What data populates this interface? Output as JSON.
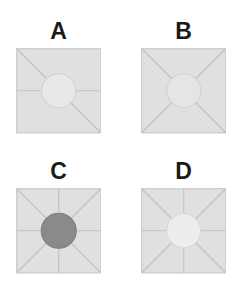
{
  "figure": {
    "background_color": "#ffffff",
    "square_fill": "#e0e0e0",
    "square_stroke": "#cfcfcf",
    "spoke_color": "#c2c2c2",
    "label_color": "#1a1a1a",
    "square_size": 84,
    "circle_radius": 17
  },
  "panels": [
    {
      "id": "a",
      "label": "A",
      "circle_fill": "#e9e9e9",
      "circle_stroke": "#d2d2d2",
      "circle_shade": "light",
      "spokes": [
        "top-left",
        "bottom-right",
        "left",
        "right"
      ],
      "spoke_count": 4,
      "pattern": "diagonal-and-horizontal"
    },
    {
      "id": "b",
      "label": "B",
      "circle_fill": "#e5e5e5",
      "circle_stroke": "#d2d2d2",
      "circle_shade": "light",
      "spokes": [
        "top-left",
        "top-right",
        "bottom-left",
        "bottom-right"
      ],
      "spoke_count": 4,
      "pattern": "diagonals-only"
    },
    {
      "id": "c",
      "label": "C",
      "circle_fill": "#8a8a8a",
      "circle_stroke": "#7e7e7e",
      "circle_shade": "dark",
      "spokes": [
        "top-left",
        "top-right",
        "bottom-left",
        "bottom-right",
        "top",
        "bottom",
        "left",
        "right"
      ],
      "spoke_count": 8,
      "pattern": "eight-spoke"
    },
    {
      "id": "d",
      "label": "D",
      "circle_fill": "#ededed",
      "circle_stroke": "#d8d8d8",
      "circle_shade": "very-light",
      "spokes": [
        "top-left",
        "top-right",
        "bottom-left",
        "bottom-right",
        "top",
        "bottom",
        "left",
        "right"
      ],
      "spoke_count": 8,
      "pattern": "eight-spoke"
    }
  ]
}
